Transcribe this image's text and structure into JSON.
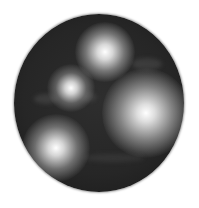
{
  "image": {
    "subject": "dark grayscale sphere with four diffuse bright spots",
    "background_color": "#ffffff",
    "sphere_color": "#2a2a2a",
    "highlight_color": "#ffffff",
    "sphere": {
      "x": 14,
      "y": 14,
      "width": 170,
      "height": 178
    },
    "spots": [
      {
        "name": "top-spot",
        "cx": 105,
        "cy": 52,
        "r": 24
      },
      {
        "name": "upper-left-spot",
        "cx": 71,
        "cy": 88,
        "r": 18
      },
      {
        "name": "right-spot",
        "cx": 144,
        "cy": 112,
        "r": 34
      },
      {
        "name": "lower-left-spot",
        "cx": 56,
        "cy": 148,
        "r": 26
      }
    ]
  }
}
